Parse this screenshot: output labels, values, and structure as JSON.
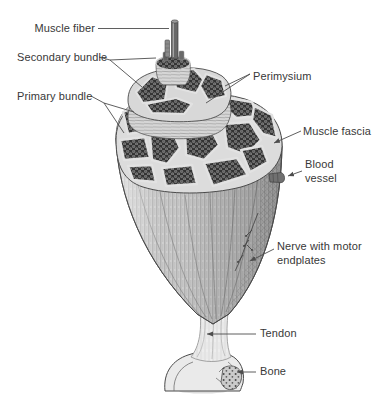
{
  "figure": {
    "labels": {
      "muscle_fiber": "Muscle fiber",
      "secondary_bundle": "Secondary bundle",
      "primary_bundle": "Primary bundle",
      "perimysium": "Perimysium",
      "muscle_fascia": "Muscle fascia",
      "blood_vessel": "Blood vessel",
      "nerve": "Nerve with motor endplates",
      "tendon": "Tendon",
      "bone": "Bone"
    },
    "colors": {
      "background": "#ffffff",
      "label_text": "#383838",
      "leader_line": "#4d4d4d",
      "outline": "#4a4a4a",
      "bundle_dark": "#333333",
      "fiber_dot_light": "#aaaaaa",
      "perimysium_light": "#dcdcdc",
      "muscle_body": "#cfcfcf",
      "tendon_light": "#ededed",
      "bone_light": "#eaeaea"
    }
  }
}
